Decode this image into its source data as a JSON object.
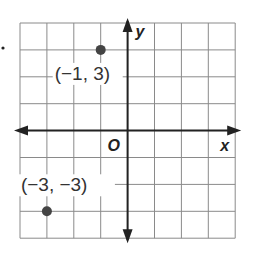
{
  "chart_data": {
    "type": "scatter",
    "title": "",
    "xlabel": "x",
    "ylabel": "y",
    "origin_label": "O",
    "xlim": [
      -4,
      4
    ],
    "ylim": [
      -4,
      4
    ],
    "grid": true,
    "points": [
      {
        "x": -1,
        "y": 3,
        "label": "(−1, 3)"
      },
      {
        "x": -3,
        "y": -3,
        "label": "(−3, −3)"
      }
    ]
  },
  "bullet": "."
}
